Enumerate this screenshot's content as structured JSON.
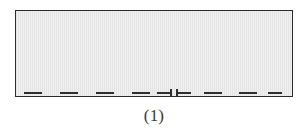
{
  "figure": {
    "caption": "(1)",
    "type": "technical-diagram",
    "canvas": {
      "width": 308,
      "height": 134,
      "background": "#ffffff"
    },
    "specimen": {
      "name": "hatched-rectangle",
      "x": 15,
      "y": 10,
      "width": 278,
      "height": 87,
      "fill_color": "#e9e9e9",
      "stripe_color": "#efefef",
      "border_color": "#2b2b2b",
      "border_width": 1.4
    },
    "interface_line": {
      "name": "dashed-interface-line",
      "y": 89,
      "color": "#2e2e2e",
      "dash_height": 2,
      "tick_height": 8,
      "dashes": [
        {
          "x": 9,
          "width": 18
        },
        {
          "x": 45,
          "width": 18
        },
        {
          "x": 81,
          "width": 18
        },
        {
          "x": 117,
          "width": 18
        },
        {
          "x": 142,
          "width": 13
        },
        {
          "x": 163,
          "width": 13
        },
        {
          "x": 189,
          "width": 18
        },
        {
          "x": 224,
          "width": 18
        },
        {
          "x": 253,
          "width": 14
        },
        {
          "x": 268,
          "width": 0
        }
      ],
      "ticks": [
        {
          "x": 155,
          "label": "left-gap-tick"
        },
        {
          "x": 161,
          "label": "right-gap-tick"
        }
      ]
    }
  }
}
